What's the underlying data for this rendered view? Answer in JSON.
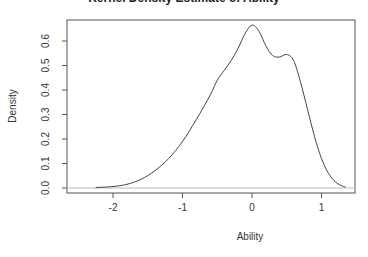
{
  "chart_data": {
    "type": "line",
    "title": "Kernel Density Estimate of Ability",
    "xlabel": "Ability",
    "ylabel": "Density",
    "xlim": [
      -2.6,
      1.5
    ],
    "ylim": [
      -0.02,
      0.69
    ],
    "x_ticks": [
      -2,
      -1,
      0,
      1
    ],
    "x_tick_labels": [
      "-2",
      "-1",
      "0",
      "1"
    ],
    "y_ticks": [
      0.0,
      0.1,
      0.2,
      0.3,
      0.4,
      0.5,
      0.6
    ],
    "y_tick_labels": [
      "0.0",
      "0.1",
      "0.2",
      "0.3",
      "0.4",
      "0.5",
      "0.6"
    ],
    "grid": false,
    "baseline": 0,
    "series": [
      {
        "name": "density",
        "x": [
          -2.25,
          -2.0,
          -1.8,
          -1.6,
          -1.4,
          -1.2,
          -1.0,
          -0.8,
          -0.6,
          -0.5,
          -0.4,
          -0.3,
          -0.2,
          -0.1,
          0.0,
          0.1,
          0.2,
          0.3,
          0.4,
          0.5,
          0.6,
          0.7,
          0.8,
          0.9,
          1.0,
          1.1,
          1.2,
          1.3,
          1.35
        ],
        "y": [
          0.002,
          0.006,
          0.015,
          0.035,
          0.07,
          0.12,
          0.19,
          0.28,
          0.38,
          0.44,
          0.48,
          0.52,
          0.57,
          0.63,
          0.665,
          0.64,
          0.58,
          0.54,
          0.535,
          0.545,
          0.52,
          0.43,
          0.32,
          0.21,
          0.12,
          0.06,
          0.025,
          0.008,
          0.004
        ]
      }
    ]
  }
}
